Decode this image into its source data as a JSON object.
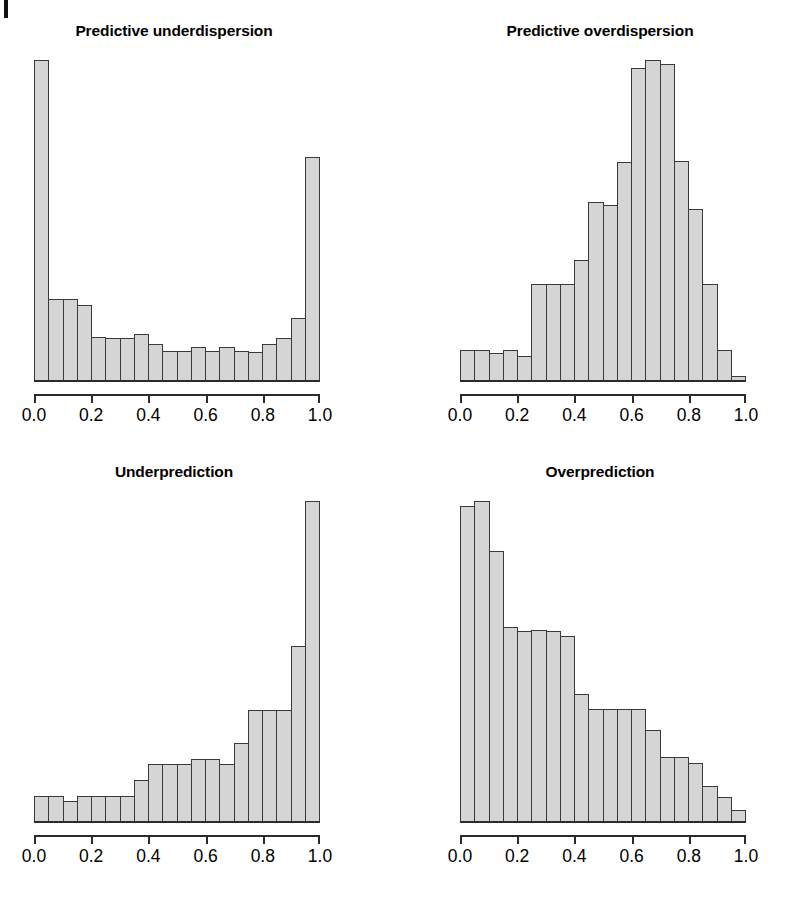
{
  "figure": {
    "background": "#ffffff",
    "bar_fill": "#d5d5d5",
    "bar_stroke": "#3a3a3a",
    "axis_color": "#2b2b2b",
    "edge_mark": "page-edge-artifact"
  },
  "axis": {
    "tick_labels": [
      "0.0",
      "0.2",
      "0.4",
      "0.6",
      "0.8",
      "1.0"
    ],
    "tick_positions": [
      0.0,
      0.2,
      0.4,
      0.6,
      0.8,
      1.0
    ]
  },
  "panels": [
    {
      "id": "predictive-underdispersion",
      "title": "Predictive underdispersion"
    },
    {
      "id": "predictive-overdispersion",
      "title": "Predictive overdispersion"
    },
    {
      "id": "underprediction",
      "title": "Underprediction"
    },
    {
      "id": "overprediction",
      "title": "Overprediction"
    }
  ],
  "chart_data": [
    {
      "type": "bar",
      "title": "Predictive underdispersion",
      "xlabel": "",
      "ylabel": "",
      "xlim": [
        0.0,
        1.0
      ],
      "bins": 20,
      "bin_width": 0.05,
      "grid": false,
      "legend": "none",
      "categories": [
        "0.00-0.05",
        "0.05-0.10",
        "0.10-0.15",
        "0.15-0.20",
        "0.20-0.25",
        "0.25-0.30",
        "0.30-0.35",
        "0.35-0.40",
        "0.40-0.45",
        "0.45-0.50",
        "0.50-0.55",
        "0.55-0.60",
        "0.60-0.65",
        "0.65-0.70",
        "0.70-0.75",
        "0.75-0.80",
        "0.80-0.85",
        "0.85-0.90",
        "0.90-0.95",
        "0.95-1.00"
      ],
      "values": [
        100.0,
        25.7,
        25.7,
        24.0,
        14.0,
        13.7,
        13.7,
        15.0,
        11.7,
        9.7,
        9.7,
        11.0,
        9.7,
        11.0,
        9.7,
        9.3,
        11.7,
        13.7,
        20.0,
        70.0
      ]
    },
    {
      "type": "bar",
      "title": "Predictive overdispersion",
      "xlabel": "",
      "ylabel": "",
      "xlim": [
        0.0,
        1.0
      ],
      "bins": 20,
      "bin_width": 0.05,
      "grid": false,
      "legend": "none",
      "categories": [
        "0.00-0.05",
        "0.05-0.10",
        "0.10-0.15",
        "0.15-0.20",
        "0.20-0.25",
        "0.25-0.30",
        "0.30-0.35",
        "0.35-0.40",
        "0.40-0.45",
        "0.45-0.50",
        "0.50-0.55",
        "0.55-0.60",
        "0.60-0.65",
        "0.65-0.70",
        "0.70-0.75",
        "0.75-0.80",
        "0.80-0.85",
        "0.85-0.90",
        "0.90-0.95",
        "0.95-1.00"
      ],
      "values": [
        9.7,
        9.7,
        8.7,
        9.7,
        8.0,
        29.7,
        29.7,
        29.7,
        37.0,
        54.7,
        54.0,
        67.0,
        95.7,
        98.0,
        96.7,
        67.3,
        52.7,
        29.7,
        9.7,
        1.7
      ]
    },
    {
      "type": "bar",
      "title": "Underprediction",
      "xlabel": "",
      "ylabel": "",
      "xlim": [
        0.0,
        1.0
      ],
      "bins": 20,
      "bin_width": 0.05,
      "grid": false,
      "legend": "none",
      "categories": [
        "0.00-0.05",
        "0.05-0.10",
        "0.10-0.15",
        "0.15-0.20",
        "0.20-0.25",
        "0.25-0.30",
        "0.30-0.35",
        "0.35-0.40",
        "0.40-0.45",
        "0.45-0.50",
        "0.50-0.55",
        "0.55-0.60",
        "0.60-0.65",
        "0.65-0.70",
        "0.70-0.75",
        "0.75-0.80",
        "0.80-0.85",
        "0.85-0.90",
        "0.90-0.95",
        "0.95-1.00"
      ],
      "values": [
        8.3,
        8.3,
        6.7,
        8.3,
        8.3,
        8.3,
        8.3,
        13.3,
        18.3,
        18.3,
        18.3,
        20.0,
        20.0,
        18.3,
        25.0,
        35.0,
        35.0,
        35.0,
        55.0,
        100.0
      ]
    },
    {
      "type": "bar",
      "title": "Overprediction",
      "xlabel": "",
      "ylabel": "",
      "xlim": [
        0.0,
        1.0
      ],
      "bins": 20,
      "bin_width": 0.05,
      "grid": false,
      "legend": "none",
      "categories": [
        "0.00-0.05",
        "0.05-0.10",
        "0.10-0.15",
        "0.15-0.20",
        "0.20-0.25",
        "0.25-0.30",
        "0.30-0.35",
        "0.35-0.40",
        "0.40-0.45",
        "0.45-0.50",
        "0.50-0.55",
        "0.55-0.60",
        "0.60-0.65",
        "0.65-0.70",
        "0.70-0.75",
        "0.75-0.80",
        "0.80-0.85",
        "0.85-0.90",
        "0.90-0.95",
        "0.95-1.00"
      ],
      "values": [
        98.3,
        100.0,
        84.5,
        61.0,
        59.5,
        60.0,
        59.5,
        58.0,
        40.0,
        35.5,
        35.5,
        35.5,
        35.5,
        29.0,
        20.5,
        20.5,
        18.5,
        11.5,
        8.0,
        4.0
      ]
    }
  ]
}
